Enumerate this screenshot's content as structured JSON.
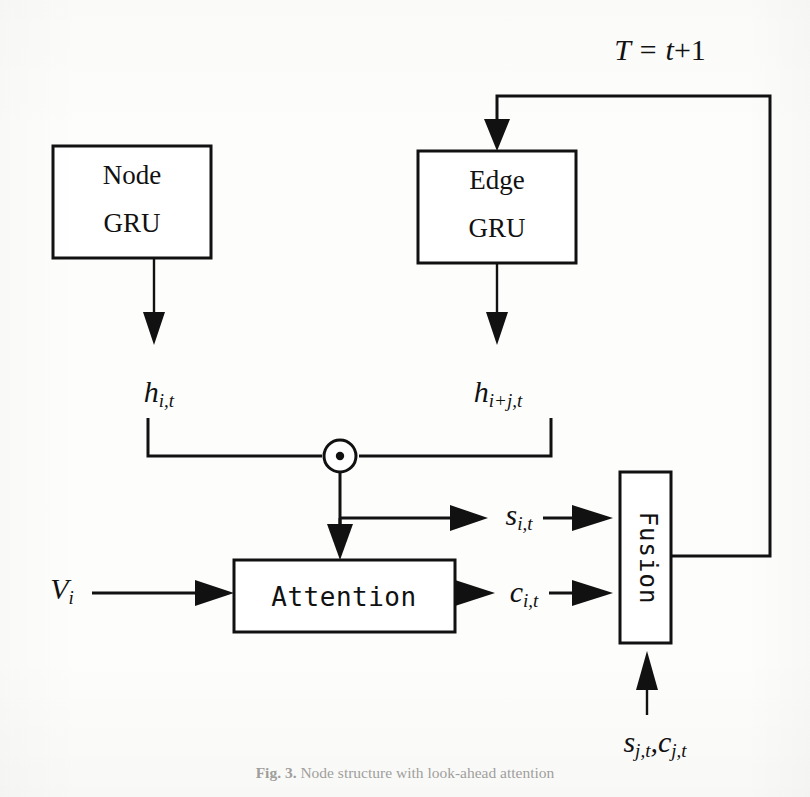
{
  "figure": {
    "domain": "diagram",
    "caption_label": "Fig. 3.",
    "caption_text": "Node structure with look-ahead attention",
    "background_color": "#fdfdfc",
    "ink_color": "#111111"
  },
  "nodes": {
    "node_gru": {
      "line1": "Node",
      "line2": "GRU"
    },
    "edge_gru": {
      "line1": "Edge",
      "line2": "GRU"
    },
    "attention": {
      "label": "Attention"
    },
    "fusion": {
      "label": "Fusion",
      "orientation": "vertical"
    }
  },
  "labels": {
    "timestep": {
      "base": "T = t",
      "plus": "+1",
      "full": "T = t+1"
    },
    "h_node": {
      "base": "h",
      "sub": "i,t"
    },
    "h_edge": {
      "base": "h",
      "sub": "i+j,t"
    },
    "s_out": {
      "base": "s",
      "sub": "i,t"
    },
    "c_out": {
      "base": "c",
      "sub": "i,t"
    },
    "v_in": {
      "base": "V",
      "sub": "i"
    },
    "neighbor_in": {
      "base_1": "s",
      "sub_1": "j,t",
      "sep": ",",
      "base_2": "c",
      "sub_2": "j,t",
      "full": "s_{j,t}, c_{j,t}"
    }
  },
  "operators": {
    "hadamard": {
      "name": "element-wise-product",
      "glyph": "⊙"
    }
  },
  "edges": [
    {
      "name": "node-gru-to-h",
      "from": "node_gru",
      "to": "h_node"
    },
    {
      "name": "edge-gru-to-h",
      "from": "edge_gru",
      "to": "h_edge"
    },
    {
      "name": "h-node-to-hadamard",
      "from": "h_node",
      "to": "hadamard"
    },
    {
      "name": "h-edge-to-hadamard",
      "from": "h_edge",
      "to": "hadamard"
    },
    {
      "name": "hadamard-to-attention",
      "from": "hadamard",
      "to": "attention"
    },
    {
      "name": "hadamard-to-s",
      "from": "hadamard",
      "to": "s_out"
    },
    {
      "name": "s-to-fusion",
      "from": "s_out",
      "to": "fusion"
    },
    {
      "name": "v-to-attention",
      "from": "v_in",
      "to": "attention"
    },
    {
      "name": "attention-to-c",
      "from": "attention",
      "to": "c_out"
    },
    {
      "name": "c-to-fusion",
      "from": "c_out",
      "to": "fusion"
    },
    {
      "name": "neighbor-to-fusion",
      "from": "neighbor_in",
      "to": "fusion"
    },
    {
      "name": "fusion-feedback-to-edge-gru",
      "from": "fusion",
      "to": "edge_gru",
      "label": "T = t+1"
    }
  ]
}
